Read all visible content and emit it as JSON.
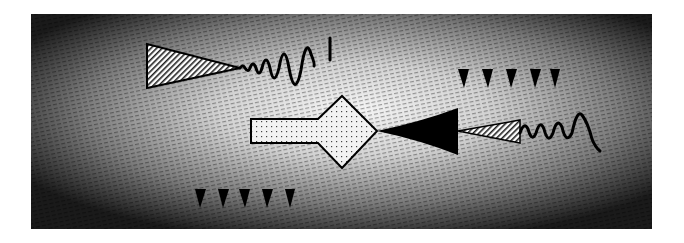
{
  "figure": {
    "background": {
      "edge_color": "#111111",
      "center_color": "#f4f4f4",
      "frame": {
        "x": 31,
        "y": 14,
        "width": 621,
        "height": 215
      }
    },
    "colors": {
      "ink": "#000000",
      "hatch": "#222222",
      "page": "#ffffff"
    },
    "elements": {
      "emitter_top_left": {
        "label": "",
        "shape": "hatched-cone-with-wave"
      },
      "emitter_right": {
        "label": "",
        "shape": "hatched-cone-with-wave"
      },
      "horn_black": {
        "label": "",
        "shape": "filled-triangle"
      },
      "splitter": {
        "label": "",
        "shape": "rectangle-plus-diamond"
      },
      "marker_row_top": {
        "count": 5
      },
      "marker_row_bottom": {
        "count": 5
      }
    }
  }
}
